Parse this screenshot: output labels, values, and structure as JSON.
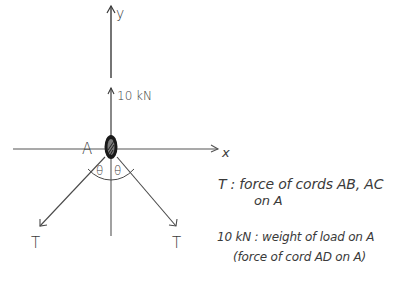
{
  "diagram": {
    "axes": {
      "x_label": "x",
      "y_label": "y"
    },
    "node": {
      "label": "A"
    },
    "forces": [
      {
        "name": "load",
        "label": "10 kN",
        "direction": "up"
      },
      {
        "name": "tension-left",
        "label": "T",
        "direction": "down-left"
      },
      {
        "name": "tension-right",
        "label": "T",
        "direction": "down-right"
      }
    ],
    "angles": [
      {
        "label": "θ",
        "side": "left"
      },
      {
        "label": "θ",
        "side": "right"
      }
    ],
    "legend": [
      {
        "line1": "T : force of cords AB, AC",
        "line2": "on A"
      },
      {
        "line1": "10 kN : weight of load on A",
        "line2": "(force of cord AD on A)"
      }
    ],
    "colors": {
      "stroke": "#4a4a4a",
      "node_fill": "#1a1a1a",
      "background": "#ffffff"
    }
  }
}
